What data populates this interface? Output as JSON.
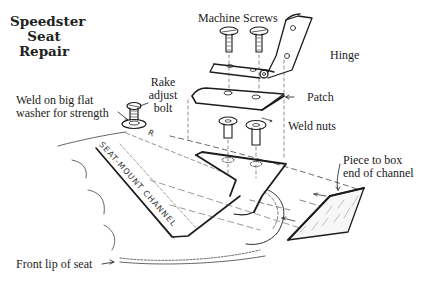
{
  "title": {
    "lines": [
      "Speedster",
      "Seat",
      "Repair"
    ]
  },
  "labels": {
    "machine_screws": "Machine Screws",
    "hinge": "Hinge",
    "patch": "Patch",
    "weld_nuts": "Weld nuts",
    "rake_adjust_bolt": [
      "Rake",
      "adjust",
      "bolt"
    ],
    "weld_washer": [
      "Weld on big flat",
      "washer for strength"
    ],
    "piece_to_box": [
      "Piece to box",
      "end of channel"
    ],
    "front_lip": "Front lip of seat",
    "channel_text": "SEAT-MOUNT CHANNEL",
    "channel_text_2": "R"
  },
  "colors": {
    "ink": "#1c1c1c",
    "background": "#ffffff",
    "hatch": "#777777"
  }
}
